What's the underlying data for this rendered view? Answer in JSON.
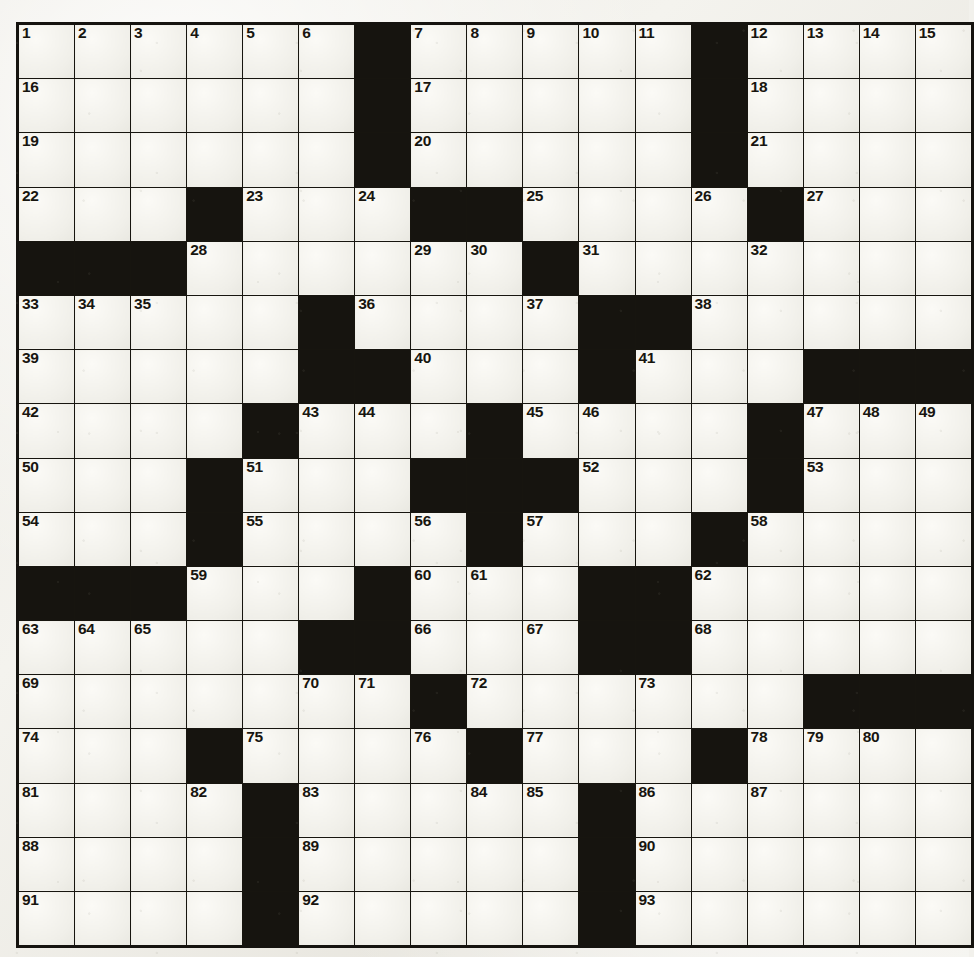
{
  "puzzle": {
    "type": "crossword-grid",
    "rows": 17,
    "cols": 17,
    "colors": {
      "paper": "#f1f0ea",
      "cell_white": "#f0efe9",
      "cell_black": "#16140f",
      "grid_line": "#17150f",
      "number_text": "#17150f"
    },
    "grid": [
      [
        "w",
        "w",
        "w",
        "w",
        "w",
        "w",
        "b",
        "w",
        "w",
        "w",
        "w",
        "w",
        "b",
        "w",
        "w",
        "w",
        "w"
      ],
      [
        "w",
        "w",
        "w",
        "w",
        "w",
        "w",
        "b",
        "w",
        "w",
        "w",
        "w",
        "w",
        "b",
        "w",
        "w",
        "w",
        "w"
      ],
      [
        "w",
        "w",
        "w",
        "w",
        "w",
        "w",
        "b",
        "w",
        "w",
        "w",
        "w",
        "w",
        "b",
        "w",
        "w",
        "w",
        "w"
      ],
      [
        "w",
        "w",
        "w",
        "b",
        "w",
        "w",
        "w",
        "b",
        "b",
        "w",
        "w",
        "w",
        "w",
        "b",
        "w",
        "w",
        "w"
      ],
      [
        "b",
        "b",
        "b",
        "w",
        "w",
        "w",
        "w",
        "w",
        "w",
        "b",
        "w",
        "w",
        "w",
        "w",
        "w",
        "w",
        "w"
      ],
      [
        "w",
        "w",
        "w",
        "w",
        "w",
        "b",
        "w",
        "w",
        "w",
        "w",
        "b",
        "b",
        "w",
        "w",
        "w",
        "w",
        "w"
      ],
      [
        "w",
        "w",
        "w",
        "w",
        "w",
        "b",
        "b",
        "w",
        "w",
        "w",
        "b",
        "w",
        "w",
        "w",
        "b",
        "b",
        "b"
      ],
      [
        "w",
        "w",
        "w",
        "w",
        "b",
        "w",
        "w",
        "w",
        "b",
        "w",
        "w",
        "w",
        "w",
        "b",
        "w",
        "w",
        "w"
      ],
      [
        "w",
        "w",
        "w",
        "b",
        "w",
        "w",
        "w",
        "b",
        "b",
        "b",
        "w",
        "w",
        "w",
        "b",
        "w",
        "w",
        "w"
      ],
      [
        "w",
        "w",
        "w",
        "b",
        "w",
        "w",
        "w",
        "w",
        "b",
        "w",
        "w",
        "w",
        "b",
        "w",
        "w",
        "w",
        "w"
      ],
      [
        "b",
        "b",
        "b",
        "w",
        "w",
        "w",
        "b",
        "w",
        "w",
        "w",
        "b",
        "b",
        "w",
        "w",
        "w",
        "w",
        "w"
      ],
      [
        "w",
        "w",
        "w",
        "w",
        "w",
        "b",
        "b",
        "w",
        "w",
        "w",
        "b",
        "b",
        "w",
        "w",
        "w",
        "w",
        "w"
      ],
      [
        "w",
        "w",
        "w",
        "w",
        "w",
        "w",
        "w",
        "b",
        "w",
        "w",
        "w",
        "w",
        "w",
        "w",
        "b",
        "b",
        "b"
      ],
      [
        "w",
        "w",
        "w",
        "b",
        "w",
        "w",
        "w",
        "w",
        "b",
        "w",
        "w",
        "w",
        "b",
        "w",
        "w",
        "w",
        "w"
      ],
      [
        "w",
        "w",
        "w",
        "w",
        "b",
        "w",
        "w",
        "w",
        "w",
        "w",
        "b",
        "w",
        "w",
        "w",
        "w",
        "w",
        "w"
      ],
      [
        "w",
        "w",
        "w",
        "w",
        "b",
        "w",
        "w",
        "w",
        "w",
        "w",
        "b",
        "w",
        "w",
        "w",
        "w",
        "w",
        "w"
      ],
      [
        "w",
        "w",
        "w",
        "w",
        "b",
        "w",
        "w",
        "w",
        "w",
        "w",
        "b",
        "w",
        "w",
        "w",
        "w",
        "w",
        "w"
      ]
    ],
    "numbers": [
      [
        1,
        2,
        3,
        4,
        5,
        6,
        null,
        7,
        8,
        9,
        10,
        11,
        null,
        12,
        13,
        14,
        15
      ],
      [
        16,
        null,
        null,
        null,
        null,
        null,
        null,
        17,
        null,
        null,
        null,
        null,
        null,
        18,
        null,
        null,
        null
      ],
      [
        19,
        null,
        null,
        null,
        null,
        null,
        null,
        20,
        null,
        null,
        null,
        null,
        null,
        21,
        null,
        null,
        null
      ],
      [
        22,
        null,
        null,
        null,
        23,
        null,
        24,
        null,
        null,
        25,
        null,
        null,
        26,
        null,
        27,
        null,
        null
      ],
      [
        null,
        null,
        null,
        28,
        null,
        null,
        null,
        29,
        30,
        null,
        31,
        null,
        null,
        32,
        null,
        null,
        null
      ],
      [
        33,
        34,
        35,
        null,
        null,
        null,
        36,
        null,
        null,
        37,
        null,
        null,
        38,
        null,
        null,
        null,
        null
      ],
      [
        39,
        null,
        null,
        null,
        null,
        null,
        null,
        40,
        null,
        null,
        null,
        41,
        null,
        null,
        null,
        null,
        null
      ],
      [
        42,
        null,
        null,
        null,
        null,
        43,
        44,
        null,
        null,
        45,
        46,
        null,
        null,
        null,
        47,
        48,
        49
      ],
      [
        50,
        null,
        null,
        null,
        51,
        null,
        null,
        null,
        null,
        null,
        52,
        null,
        null,
        null,
        53,
        null,
        null
      ],
      [
        54,
        null,
        null,
        null,
        55,
        null,
        null,
        56,
        null,
        57,
        null,
        null,
        null,
        58,
        null,
        null,
        null
      ],
      [
        null,
        null,
        null,
        59,
        null,
        null,
        null,
        60,
        61,
        null,
        null,
        null,
        62,
        null,
        null,
        null,
        null
      ],
      [
        63,
        64,
        65,
        null,
        null,
        null,
        null,
        66,
        null,
        67,
        null,
        null,
        68,
        null,
        null,
        null,
        null
      ],
      [
        69,
        null,
        null,
        null,
        null,
        70,
        71,
        null,
        72,
        null,
        null,
        73,
        null,
        null,
        null,
        null,
        null
      ],
      [
        74,
        null,
        null,
        null,
        75,
        null,
        null,
        76,
        null,
        77,
        null,
        null,
        null,
        78,
        79,
        80,
        null
      ],
      [
        81,
        null,
        null,
        82,
        null,
        83,
        null,
        null,
        84,
        85,
        null,
        86,
        null,
        87,
        null,
        null,
        null
      ],
      [
        88,
        null,
        null,
        null,
        null,
        89,
        null,
        null,
        null,
        null,
        null,
        90,
        null,
        null,
        null,
        null,
        null
      ],
      [
        91,
        null,
        null,
        null,
        null,
        92,
        null,
        null,
        null,
        null,
        null,
        93,
        null,
        null,
        null,
        null,
        null
      ]
    ]
  }
}
